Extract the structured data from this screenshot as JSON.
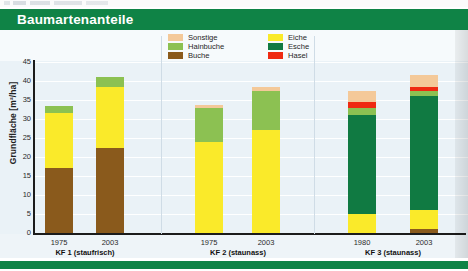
{
  "banner": {
    "title": "Baumartenanteile"
  },
  "chart_data": {
    "type": "bar",
    "stacked": true,
    "title": "Baumartenanteile",
    "xlabel": "",
    "ylabel": "Grundfläche [m²/ha]",
    "ylim": [
      0,
      45
    ],
    "yticks": [
      0,
      5,
      10,
      15,
      20,
      25,
      30,
      35,
      40,
      45
    ],
    "grid": true,
    "legend_position": "top-center",
    "legend": [
      "Sonstige",
      "Hainbuche",
      "Buche",
      "Eiche",
      "Esche",
      "Hasel"
    ],
    "colors": {
      "Sonstige": "#f4c999",
      "Hainbuche": "#8cc152",
      "Buche": "#8a5a1c",
      "Eiche": "#faea2a",
      "Esche": "#107a42",
      "Hasel": "#ef2a12"
    },
    "groups": [
      {
        "label": "KF 1 (staufrisch)",
        "categories": [
          "1975",
          "2003"
        ]
      },
      {
        "label": "KF 2 (staunass)",
        "categories": [
          "1975",
          "2003"
        ]
      },
      {
        "label": "KF 3 (staunass)",
        "categories": [
          "1980",
          "2003"
        ]
      }
    ],
    "categories": [
      "1975",
      "2003",
      "1975",
      "2003",
      "1980",
      "2003"
    ],
    "series": [
      {
        "name": "Buche",
        "values": [
          17.0,
          22.5,
          0.0,
          0.0,
          0.0,
          1.0
        ]
      },
      {
        "name": "Eiche",
        "values": [
          14.5,
          16.0,
          24.0,
          27.0,
          5.0,
          5.0
        ]
      },
      {
        "name": "Esche",
        "values": [
          0.0,
          0.0,
          0.0,
          0.0,
          26.0,
          30.0
        ]
      },
      {
        "name": "Hainbuche",
        "values": [
          2.0,
          2.5,
          9.0,
          10.5,
          2.0,
          1.5
        ]
      },
      {
        "name": "Hasel",
        "values": [
          0.0,
          0.0,
          0.0,
          0.0,
          1.5,
          1.0
        ]
      },
      {
        "name": "Sonstige",
        "values": [
          0.0,
          0.0,
          0.7,
          0.8,
          3.0,
          3.0
        ]
      }
    ],
    "totals": [
      33.5,
      41.0,
      33.7,
      38.3,
      37.5,
      41.5
    ],
    "bars": [
      {
        "group": 0,
        "category": "1975",
        "x": 45,
        "segments": [
          {
            "name": "Buche",
            "value": 17.0
          },
          {
            "name": "Eiche",
            "value": 14.5
          },
          {
            "name": "Hainbuche",
            "value": 2.0
          }
        ]
      },
      {
        "group": 0,
        "category": "2003",
        "x": 96,
        "segments": [
          {
            "name": "Buche",
            "value": 22.5
          },
          {
            "name": "Eiche",
            "value": 16.0
          },
          {
            "name": "Hainbuche",
            "value": 2.5
          }
        ]
      },
      {
        "group": 1,
        "category": "1975",
        "x": 195,
        "segments": [
          {
            "name": "Eiche",
            "value": 24.0
          },
          {
            "name": "Hainbuche",
            "value": 9.0
          },
          {
            "name": "Sonstige",
            "value": 0.7
          }
        ]
      },
      {
        "group": 1,
        "category": "2003",
        "x": 252,
        "segments": [
          {
            "name": "Eiche",
            "value": 27.0
          },
          {
            "name": "Hainbuche",
            "value": 10.5
          },
          {
            "name": "Sonstige",
            "value": 0.8
          }
        ]
      },
      {
        "group": 2,
        "category": "1980",
        "x": 348,
        "segments": [
          {
            "name": "Eiche",
            "value": 5.0
          },
          {
            "name": "Esche",
            "value": 26.0
          },
          {
            "name": "Hainbuche",
            "value": 2.0
          },
          {
            "name": "Hasel",
            "value": 1.5
          },
          {
            "name": "Sonstige",
            "value": 3.0
          }
        ]
      },
      {
        "group": 2,
        "category": "2003",
        "x": 410,
        "segments": [
          {
            "name": "Buche",
            "value": 1.0
          },
          {
            "name": "Eiche",
            "value": 5.0
          },
          {
            "name": "Esche",
            "value": 30.0
          },
          {
            "name": "Hainbuche",
            "value": 1.5
          },
          {
            "name": "Hasel",
            "value": 1.0
          },
          {
            "name": "Sonstige",
            "value": 3.0
          }
        ]
      }
    ]
  }
}
